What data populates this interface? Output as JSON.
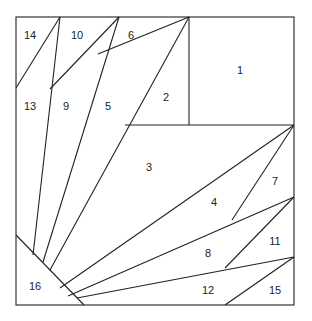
{
  "diagram": {
    "type": "foundation-piecing-pattern",
    "stroke_color": "#222222",
    "background": "#ffffff",
    "border": {
      "x1": 16,
      "y1": 17,
      "x2": 294,
      "y2": 305
    },
    "pieces": [
      {
        "id": "1",
        "label": "1",
        "x": 240,
        "y": 71
      },
      {
        "id": "2",
        "label": "2",
        "x": 166,
        "y": 98
      },
      {
        "id": "3",
        "label": "3",
        "x": 149,
        "y": 168
      },
      {
        "id": "4",
        "label": "4",
        "x": 214,
        "y": 203
      },
      {
        "id": "5",
        "label": "5",
        "x": 108,
        "y": 107
      },
      {
        "id": "6",
        "label": "6",
        "x": 131,
        "y": 36
      },
      {
        "id": "7",
        "label": "7",
        "x": 275,
        "y": 182
      },
      {
        "id": "8",
        "label": "8",
        "x": 208,
        "y": 254
      },
      {
        "id": "9",
        "label": "9",
        "x": 66,
        "y": 107
      },
      {
        "id": "10",
        "label": "10",
        "x": 77,
        "y": 36
      },
      {
        "id": "11",
        "label": "11",
        "x": 275,
        "y": 242
      },
      {
        "id": "12",
        "label": "12",
        "x": 208,
        "y": 291
      },
      {
        "id": "13",
        "label": "13",
        "x": 30,
        "y": 107
      },
      {
        "id": "14",
        "label": "14",
        "x": 30,
        "y": 36
      },
      {
        "id": "15",
        "label": "15",
        "x": 275,
        "y": 291
      },
      {
        "id": "16",
        "label": "16",
        "x": 35,
        "y": 287
      }
    ]
  }
}
